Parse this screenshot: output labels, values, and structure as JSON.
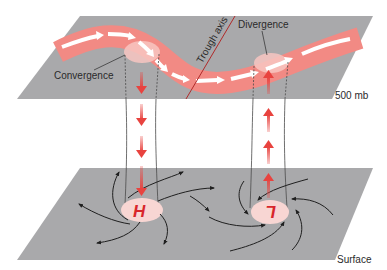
{
  "diagram": {
    "upper_level": {
      "label": "500 mb",
      "convergence_label": "Convergence",
      "divergence_label": "Divergence",
      "trough_label": "Trough axis"
    },
    "surface_level": {
      "label": "Surface",
      "high_label": "H",
      "low_label": "L"
    },
    "colors": {
      "plane": "#a9a9ab",
      "jet_stream": "#f28a84",
      "jet_arrows": "#ffffff",
      "center_disc": "#f8d6d3",
      "vertical_arrows": "#e8433f",
      "trough_line": "#b02a2a",
      "streamlines": "#1f1f1f",
      "text": "#2a2a2a",
      "pressure_letters": "#d8262b"
    },
    "vertical_motion": {
      "high": "descending",
      "low": "ascending"
    }
  }
}
